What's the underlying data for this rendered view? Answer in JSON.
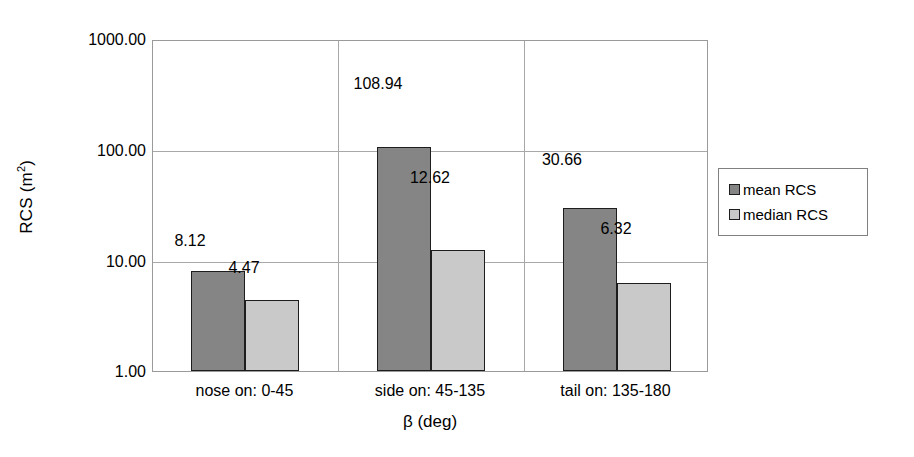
{
  "chart_data": {
    "type": "bar",
    "title": "",
    "xlabel": "β (deg)",
    "ylabel": "RCS (m²)",
    "ylabel_base": "RCS (m",
    "ylabel_sup": "2",
    "ylabel_tail": ")",
    "yscale": "log",
    "ylim": [
      1,
      1000
    ],
    "grid": true,
    "ytick_labels": [
      "1000.00",
      "100.00",
      "10.00",
      "1.00"
    ],
    "ytick_values": [
      1000,
      100,
      10,
      1
    ],
    "categories": [
      "nose on:  0-45",
      "side on: 45-135",
      "tail on: 135-180"
    ],
    "legend_position": "right",
    "series": [
      {
        "name": "mean RCS",
        "color": "#858585",
        "values": [
          8.12,
          108.94,
          30.66
        ],
        "labels": [
          "8.12",
          "108.94",
          "30.66"
        ]
      },
      {
        "name": "median RCS",
        "color": "#c9c9c9",
        "values": [
          4.47,
          12.62,
          6.32
        ],
        "labels": [
          "4.47",
          "12.62",
          "6.32"
        ]
      }
    ]
  },
  "legend": {
    "items": [
      {
        "label": "mean RCS",
        "swatch": "mean"
      },
      {
        "label": "median RCS",
        "swatch": "median"
      }
    ]
  }
}
